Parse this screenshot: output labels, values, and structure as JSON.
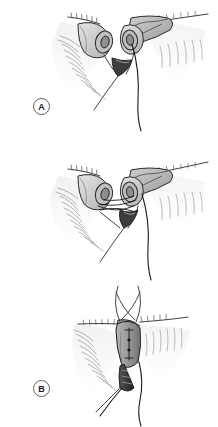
{
  "figure": {
    "background_color": "#ffffff",
    "width": 218,
    "height": 427,
    "ink_color": "#1a1a1a",
    "tissue_fill": "#d9d9d9",
    "tissue_fill_dark": "#a8a8a8",
    "lumen_fill": "#8c8c8c",
    "stent_fill": "#3a3a3a",
    "lash_color": "#9a9a9a",
    "label_ring_color": "#5e5e5e"
  },
  "panels": [
    {
      "id": "panel-a",
      "label": "A",
      "caption": "Lacerated canalicular ends identified at the medial eyelid margin",
      "structures": [
        "medial-upper-eyelid-margin",
        "lateral-eyelid-margin",
        "proximal-canaliculus-cut-end",
        "distal-canaliculus-cut-end",
        "canalicular-lumen",
        "suture-thread",
        "eyelashes"
      ]
    },
    {
      "id": "panel-b",
      "label": "B",
      "caption": "Pericanalicular sutures placed across the laceration",
      "structures": [
        "medial-upper-eyelid-margin",
        "lateral-eyelid-margin",
        "proximal-canaliculus-cut-end",
        "distal-canaliculus-cut-end",
        "crossing-suture-threads",
        "suture-thread",
        "eyelashes"
      ]
    },
    {
      "id": "panel-c",
      "label": "C",
      "caption": "Completed repair with silicone stent in place and knots tied",
      "structures": [
        "eyelid-margin",
        "repaired-canaliculus",
        "silicone-stent",
        "suture-knots",
        "suture-tails",
        "eyelashes"
      ]
    }
  ]
}
